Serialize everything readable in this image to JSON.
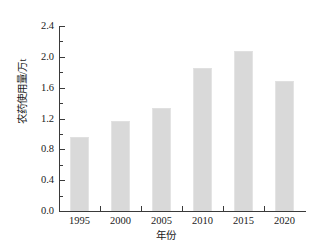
{
  "chart_data": {
    "type": "bar",
    "title": "",
    "categories": [
      "1995",
      "2000",
      "2005",
      "2010",
      "2015",
      "2020"
    ],
    "values": [
      0.96,
      1.17,
      1.33,
      1.85,
      2.07,
      1.69
    ],
    "series": [
      {
        "name": "农药使用量",
        "values": [
          0.96,
          1.17,
          1.33,
          1.85,
          2.07,
          1.69
        ]
      }
    ],
    "xlabel": "年份",
    "ylabel": "农药使用量/万t",
    "ylim": [
      0.0,
      2.4
    ],
    "ytick_labels": [
      "0.0",
      "0.4",
      "0.8",
      "1.2",
      "1.6",
      "2.0",
      "2.4"
    ],
    "ytick_values": [
      0.0,
      0.4,
      0.8,
      1.2,
      1.6,
      2.0,
      2.4
    ],
    "yminor_values": [
      0.2,
      0.6,
      1.0,
      1.4,
      1.8,
      2.2
    ],
    "xtick_labels": [
      "1995",
      "2000",
      "2005",
      "2010",
      "2015",
      "2020"
    ],
    "grid": false,
    "legend": false,
    "legend_position": "none",
    "bar_color": "#d9d9d9",
    "axis_color": "#3a3a3a",
    "text_color": "#1a1a1a",
    "background": "#ffffff"
  }
}
